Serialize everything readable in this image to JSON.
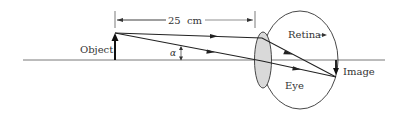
{
  "diagram": {
    "type": "optics-ray-diagram",
    "labels": {
      "object": "Object",
      "distance": "25  cm",
      "angle": "α",
      "retina": "Retina",
      "eye": "Eye",
      "image": "Image"
    },
    "colors": {
      "stroke": "#222222",
      "lens_fill": "#d9d9d9",
      "text": "#333333"
    }
  }
}
